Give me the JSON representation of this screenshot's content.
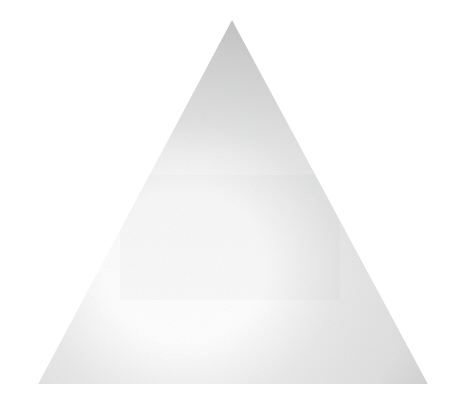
{
  "canvas": {
    "width": 455,
    "height": 402,
    "background_color": "#ffffff",
    "alt_text": "Shaded triangle"
  },
  "figure": {
    "shape_name": "triangle",
    "apex": {
      "x": 232,
      "y": 20
    },
    "bottom_left": {
      "x": 38,
      "y": 384
    },
    "bottom_right": {
      "x": 428,
      "y": 384
    },
    "points": "232,20 428,384 38,384",
    "outline": "none",
    "texture": "film-grain-noise"
  },
  "shading": {
    "type": "radial-gradient",
    "highlight_center": {
      "x": 170,
      "y": 272
    },
    "highlight_color": "#ffffff",
    "midtone_color": "#e8e8e8",
    "edge_color_top": "#b6b6b6",
    "edge_color_bottom_left": "#c9c9c9",
    "edge_color_bottom_right": "#a9aeae",
    "edge_color_right": "#b0b4b4",
    "grain_opacity": 0.1
  },
  "watermark": {
    "present": true,
    "legible": false,
    "region": {
      "x": 120,
      "y": 175,
      "width": 220,
      "height": 125
    },
    "opacity": 0.03,
    "note": "illegible ghost text"
  }
}
